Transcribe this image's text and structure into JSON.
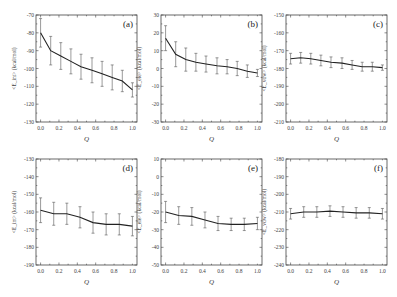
{
  "figure": {
    "width": 397,
    "height": 297
  },
  "chart_data": [
    {
      "id": "a",
      "type": "line",
      "panel_label": "(a)",
      "xlabel": "Q",
      "ylabel": "<E_int> (kcal/mol)",
      "xlim": [
        -0.05,
        1.05
      ],
      "ylim": [
        -130,
        -70
      ],
      "xticks": [
        "0.0",
        "0.2",
        "0.4",
        "0.6",
        "0.8",
        "1.0"
      ],
      "yticks": [
        "-70",
        "-80",
        "-90",
        "-100",
        "-110",
        "-120",
        "-130"
      ],
      "x": [
        0.0,
        0.11,
        0.22,
        0.33,
        0.44,
        0.56,
        0.67,
        0.78,
        0.89,
        1.0
      ],
      "y": [
        -80,
        -90,
        -93,
        -96,
        -99,
        -101,
        -103,
        -105,
        -107,
        -112
      ],
      "yerr": [
        8,
        8,
        7.5,
        7,
        7,
        7,
        7,
        7,
        6,
        4
      ],
      "box": {
        "left": 36,
        "top": 15,
        "width": 101,
        "height": 107
      }
    },
    {
      "id": "b",
      "type": "line",
      "panel_label": "(b)",
      "xlabel": "Q",
      "ylabel": "<E_ele> (kcal/mol)",
      "xlim": [
        -0.05,
        1.05
      ],
      "ylim": [
        -30,
        30
      ],
      "xticks": [
        "0.0",
        "0.2",
        "0.4",
        "0.6",
        "0.8",
        "1.0"
      ],
      "yticks": [
        "30",
        "20",
        "10",
        "0",
        "-10",
        "-20",
        "-30"
      ],
      "x": [
        0.0,
        0.11,
        0.22,
        0.33,
        0.44,
        0.56,
        0.67,
        0.78,
        0.89,
        1.0
      ],
      "y": [
        17,
        8,
        5,
        3.5,
        2.5,
        1.5,
        1,
        0,
        -1.5,
        -2.5
      ],
      "yerr": [
        7,
        7,
        6.5,
        5,
        4.5,
        4.5,
        4,
        4,
        3.5,
        2
      ],
      "box": {
        "left": 161,
        "top": 15,
        "width": 101,
        "height": 107
      }
    },
    {
      "id": "c",
      "type": "line",
      "panel_label": "(c)",
      "xlabel": "Q",
      "ylabel": "<E_vdw> (kcal/mol)",
      "xlim": [
        -0.05,
        1.05
      ],
      "ylim": [
        -210,
        -150
      ],
      "xticks": [
        "0.0",
        "0.2",
        "0.4",
        "0.6",
        "0.8",
        "1.0"
      ],
      "yticks": [
        "-150",
        "-160",
        "-170",
        "-180",
        "-190",
        "-200",
        "-210"
      ],
      "x": [
        0.0,
        0.11,
        0.22,
        0.33,
        0.44,
        0.56,
        0.67,
        0.78,
        0.89,
        1.0
      ],
      "y": [
        -174.5,
        -174,
        -174.5,
        -175.5,
        -176.5,
        -177,
        -178,
        -179,
        -179,
        -179.5
      ],
      "yerr": [
        3,
        3,
        3,
        3,
        3,
        3,
        2.5,
        2.5,
        2.5,
        1.5
      ],
      "box": {
        "left": 286,
        "top": 15,
        "width": 101,
        "height": 107
      }
    },
    {
      "id": "d",
      "type": "line",
      "panel_label": "(d)",
      "xlabel": "Q",
      "ylabel": "<E_int> (kcal/mol)",
      "xlim": [
        -0.05,
        1.05
      ],
      "ylim": [
        -190,
        -130
      ],
      "xticks": [
        "0.0",
        "0.2",
        "0.4",
        "0.6",
        "0.8",
        "1.0"
      ],
      "yticks": [
        "-130",
        "-140",
        "-150",
        "-160",
        "-170",
        "-180",
        "-190"
      ],
      "x": [
        0.0,
        0.143,
        0.286,
        0.429,
        0.571,
        0.714,
        0.857,
        1.0
      ],
      "y": [
        -159,
        -161,
        -161,
        -163,
        -166,
        -167,
        -167,
        -168
      ],
      "yerr": [
        7,
        6.5,
        6,
        6,
        6,
        6,
        6,
        5.5
      ],
      "box": {
        "left": 36,
        "top": 159,
        "width": 101,
        "height": 106
      }
    },
    {
      "id": "e",
      "type": "line",
      "panel_label": "(e)",
      "xlabel": "Q",
      "ylabel": "<E_ele> (kcal/mol)",
      "xlim": [
        -0.05,
        1.05
      ],
      "ylim": [
        -50,
        10
      ],
      "xticks": [
        "0.0",
        "0.2",
        "0.4",
        "0.6",
        "0.8",
        "1.0"
      ],
      "yticks": [
        "10",
        "0",
        "-10",
        "-20",
        "-30",
        "-40",
        "-50"
      ],
      "x": [
        0.0,
        0.143,
        0.286,
        0.429,
        0.571,
        0.714,
        0.857,
        1.0
      ],
      "y": [
        -20,
        -22,
        -22.5,
        -24.5,
        -26.5,
        -27,
        -27,
        -26.5
      ],
      "yerr": [
        6,
        5,
        5,
        4.5,
        4,
        3.5,
        3.5,
        3.5
      ],
      "box": {
        "left": 161,
        "top": 159,
        "width": 101,
        "height": 106
      }
    },
    {
      "id": "f",
      "type": "line",
      "panel_label": "(f)",
      "xlabel": "Q",
      "ylabel": "<E_vdw> (kcal/mol)",
      "xlim": [
        -0.05,
        1.05
      ],
      "ylim": [
        -240,
        -180
      ],
      "xticks": [
        "0.0",
        "0.2",
        "0.4",
        "0.6",
        "0.8",
        "1.0"
      ],
      "yticks": [
        "-180",
        "-190",
        "-200",
        "-210",
        "-220",
        "-230",
        "-240"
      ],
      "x": [
        0.0,
        0.143,
        0.286,
        0.429,
        0.571,
        0.714,
        0.857,
        1.0
      ],
      "y": [
        -211,
        -210,
        -210,
        -209.5,
        -210,
        -210.5,
        -210.5,
        -211
      ],
      "yerr": [
        3,
        3,
        3,
        3,
        3,
        3,
        3,
        3
      ],
      "box": {
        "left": 286,
        "top": 159,
        "width": 101,
        "height": 106
      }
    }
  ]
}
